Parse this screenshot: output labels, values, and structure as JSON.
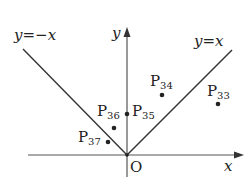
{
  "diagram": {
    "type": "coordinate-plane",
    "colors": {
      "ink": "#222222",
      "axis": "#555555",
      "background": "#ffffff"
    },
    "axes": {
      "x_label": "x",
      "y_label": "y",
      "origin_label": "O"
    },
    "lines": [
      {
        "id": "line-neg",
        "label_left": "y",
        "label_eq": "=",
        "label_right": "−x",
        "equation": "y=−x"
      },
      {
        "id": "line-pos",
        "label_left": "y",
        "label_eq": "=",
        "label_right": "x",
        "equation": "y=x"
      }
    ],
    "points": [
      {
        "id": "p33",
        "letter": "P",
        "index": "33"
      },
      {
        "id": "p34",
        "letter": "P",
        "index": "34"
      },
      {
        "id": "p35",
        "letter": "P",
        "index": "35"
      },
      {
        "id": "p36",
        "letter": "P",
        "index": "36"
      },
      {
        "id": "p37",
        "letter": "P",
        "index": "37"
      }
    ]
  }
}
